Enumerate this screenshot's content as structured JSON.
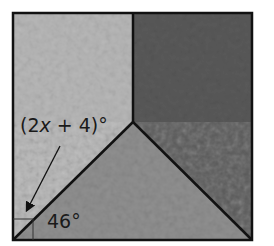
{
  "figure": {
    "square": {
      "x": 13,
      "y": 13,
      "width": 239,
      "height": 227
    },
    "vertex": {
      "x": 133,
      "y": 122
    },
    "regions": [
      {
        "name": "left-region",
        "fill": "#b4b4b4"
      },
      {
        "name": "top-right-region",
        "fill": "#5e5e5e"
      },
      {
        "name": "bottom-region",
        "fill": "#8e8e8e"
      }
    ],
    "stroke_color": "#111111"
  },
  "labels": {
    "angle_expression_prefix": "(2",
    "angle_expression_var": "x",
    "angle_expression_suffix": " + 4)°",
    "angle_46": "46°"
  },
  "annotations": {
    "arrow": "points from the (2x + 4)° label to the angle between the diagonal and the left edge at the bottom-left corner",
    "right_angle_mark": "bottom-left corner of square"
  }
}
